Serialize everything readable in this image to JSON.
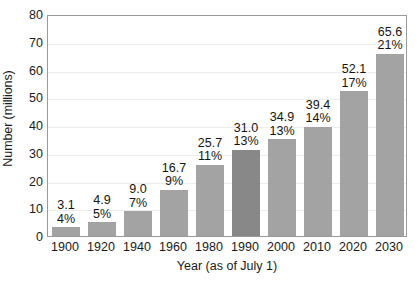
{
  "chart_data": {
    "type": "bar",
    "title": "",
    "xlabel": "Year (as of July 1)",
    "ylabel": "Number (millions)",
    "categories": [
      "1900",
      "1920",
      "1940",
      "1960",
      "1980",
      "1990",
      "2000",
      "2010",
      "2020",
      "2030"
    ],
    "values": [
      3.1,
      4.9,
      9.0,
      16.7,
      25.7,
      31.0,
      34.9,
      39.4,
      52.1,
      65.6
    ],
    "value_labels": [
      "3.1",
      "4.9",
      "9.0",
      "16.7",
      "25.7",
      "31.0",
      "34.9",
      "39.4",
      "52.1",
      "65.6"
    ],
    "percent_labels": [
      "4%",
      "5%",
      "7%",
      "9%",
      "11%",
      "13%",
      "13%",
      "14%",
      "17%",
      "21%"
    ],
    "highlighted_categories": [
      "1990"
    ],
    "ylim": [
      0,
      80
    ],
    "yticks": [
      0,
      10,
      20,
      30,
      40,
      50,
      60,
      70,
      80
    ],
    "ytick_labels": [
      "0",
      "10",
      "20",
      "30",
      "40",
      "50",
      "60",
      "70",
      "80"
    ],
    "grid": true,
    "legend": "none",
    "colors": {
      "bar": "#a3a3a3",
      "bar_highlight": "#888888",
      "gridline": "#ededed",
      "frame": "#9a9a9a",
      "text": "#1a1a1a",
      "background": "#ffffff"
    }
  }
}
